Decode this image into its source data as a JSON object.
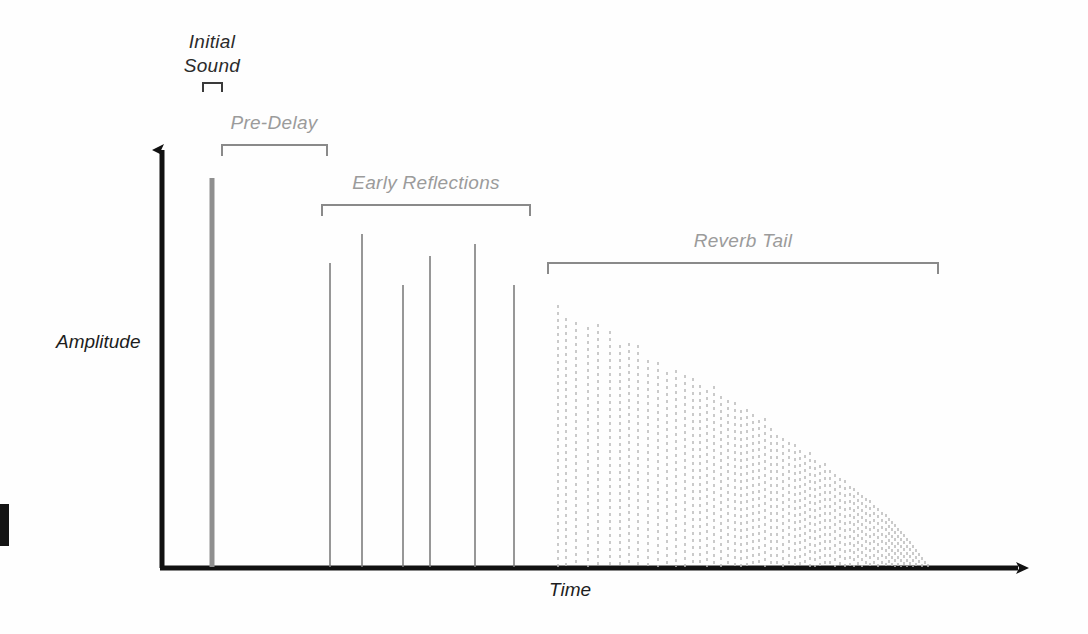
{
  "figure": {
    "axes": {
      "x_label": "Time",
      "y_label": "Amplitude",
      "x_arrow": "arrow-right",
      "y_arrow": "arrow-up"
    },
    "annotations": [
      {
        "id": "initial-sound",
        "label": "Initial Sound",
        "line1": "Initial",
        "line2": "Sound"
      },
      {
        "id": "pre-delay",
        "label": "Pre-Delay"
      },
      {
        "id": "early-reflections",
        "label": "Early Reflections"
      },
      {
        "id": "reverb-tail",
        "label": "Reverb Tail"
      }
    ],
    "colors": {
      "axis": "#111111",
      "label_gray": "#9b9b9b",
      "bracket_gray": "#8a8a8a",
      "early_reflection": "#7d7d7d",
      "reverb_tail": "#b9b9b9",
      "initial_sound": "#8f8f8f",
      "background": "#fefefe"
    }
  },
  "chart_data": {
    "type": "bar",
    "xlabel": "Time",
    "ylabel": "Amplitude",
    "grid": false,
    "legend": "none",
    "xlim": [
      0,
      1088
    ],
    "ylim": [
      0,
      1
    ],
    "baseline_y": 568,
    "axis_x": 162,
    "axis_end_x": 1030,
    "axis_top_y": 138,
    "segments": [
      {
        "name": "Initial Sound",
        "bracket": {
          "x1": 203,
          "x2": 222,
          "y": 83,
          "tick": 9
        },
        "label_xy": [
          212,
          48
        ],
        "impulses": [
          {
            "x": 212,
            "top_y": 178,
            "amplitude": 1.0,
            "style": "solid-thick"
          }
        ]
      },
      {
        "name": "Pre-Delay",
        "bracket": {
          "x1": 222,
          "x2": 327,
          "y": 145,
          "tick": 11
        },
        "label_xy": [
          274,
          129
        ],
        "impulses": []
      },
      {
        "name": "Early Reflections",
        "bracket": {
          "x1": 322,
          "x2": 530,
          "y": 205,
          "tick": 11
        },
        "label_xy": [
          426,
          189
        ],
        "impulses": [
          {
            "x": 330,
            "top_y": 263,
            "amplitude": 0.78
          },
          {
            "x": 362,
            "top_y": 234,
            "amplitude": 0.86
          },
          {
            "x": 403,
            "top_y": 285,
            "amplitude": 0.72
          },
          {
            "x": 430,
            "top_y": 256,
            "amplitude": 0.8
          },
          {
            "x": 475,
            "top_y": 244,
            "amplitude": 0.83
          },
          {
            "x": 514,
            "top_y": 285,
            "amplitude": 0.72
          }
        ]
      },
      {
        "name": "Reverb Tail",
        "bracket": {
          "x1": 548,
          "x2": 938,
          "y": 263,
          "tick": 11
        },
        "label_xy": [
          743,
          247
        ],
        "decay": "exponential",
        "dashed": true,
        "start_x": 558,
        "end_x": 928,
        "peak_top_y": 305,
        "impulses": [
          {
            "x": 558,
            "top_y": 305,
            "amplitude": 0.69
          },
          {
            "x": 566,
            "top_y": 318,
            "amplitude": 0.65
          },
          {
            "x": 576,
            "top_y": 322,
            "amplitude": 0.64
          },
          {
            "x": 588,
            "top_y": 327,
            "amplitude": 0.63
          },
          {
            "x": 598,
            "top_y": 324,
            "amplitude": 0.64
          },
          {
            "x": 610,
            "top_y": 331,
            "amplitude": 0.62
          },
          {
            "x": 620,
            "top_y": 345,
            "amplitude": 0.58
          },
          {
            "x": 629,
            "top_y": 343,
            "amplitude": 0.58
          },
          {
            "x": 638,
            "top_y": 345,
            "amplitude": 0.58
          },
          {
            "x": 648,
            "top_y": 360,
            "amplitude": 0.54
          },
          {
            "x": 658,
            "top_y": 362,
            "amplitude": 0.54
          },
          {
            "x": 667,
            "top_y": 372,
            "amplitude": 0.51
          },
          {
            "x": 676,
            "top_y": 370,
            "amplitude": 0.52
          },
          {
            "x": 685,
            "top_y": 375,
            "amplitude": 0.5
          },
          {
            "x": 693,
            "top_y": 378,
            "amplitude": 0.49
          },
          {
            "x": 700,
            "top_y": 385,
            "amplitude": 0.47
          },
          {
            "x": 707,
            "top_y": 390,
            "amplitude": 0.46
          },
          {
            "x": 714,
            "top_y": 386,
            "amplitude": 0.47
          },
          {
            "x": 721,
            "top_y": 396,
            "amplitude": 0.44
          },
          {
            "x": 728,
            "top_y": 400,
            "amplitude": 0.43
          },
          {
            "x": 735,
            "top_y": 402,
            "amplitude": 0.43
          },
          {
            "x": 741,
            "top_y": 410,
            "amplitude": 0.4
          },
          {
            "x": 747,
            "top_y": 409,
            "amplitude": 0.41
          },
          {
            "x": 753,
            "top_y": 414,
            "amplitude": 0.39
          },
          {
            "x": 759,
            "top_y": 420,
            "amplitude": 0.38
          },
          {
            "x": 765,
            "top_y": 418,
            "amplitude": 0.38
          },
          {
            "x": 771,
            "top_y": 428,
            "amplitude": 0.36
          },
          {
            "x": 777,
            "top_y": 435,
            "amplitude": 0.34
          },
          {
            "x": 783,
            "top_y": 438,
            "amplitude": 0.33
          },
          {
            "x": 789,
            "top_y": 442,
            "amplitude": 0.32
          },
          {
            "x": 795,
            "top_y": 444,
            "amplitude": 0.31
          },
          {
            "x": 800,
            "top_y": 450,
            "amplitude": 0.3
          },
          {
            "x": 805,
            "top_y": 455,
            "amplitude": 0.28
          },
          {
            "x": 810,
            "top_y": 452,
            "amplitude": 0.29
          },
          {
            "x": 815,
            "top_y": 460,
            "amplitude": 0.27
          },
          {
            "x": 820,
            "top_y": 465,
            "amplitude": 0.26
          },
          {
            "x": 825,
            "top_y": 463,
            "amplitude": 0.26
          },
          {
            "x": 830,
            "top_y": 470,
            "amplitude": 0.24
          },
          {
            "x": 835,
            "top_y": 474,
            "amplitude": 0.23
          },
          {
            "x": 840,
            "top_y": 478,
            "amplitude": 0.22
          },
          {
            "x": 845,
            "top_y": 480,
            "amplitude": 0.22
          },
          {
            "x": 850,
            "top_y": 486,
            "amplitude": 0.2
          },
          {
            "x": 854,
            "top_y": 488,
            "amplitude": 0.2
          },
          {
            "x": 858,
            "top_y": 492,
            "amplitude": 0.19
          },
          {
            "x": 862,
            "top_y": 495,
            "amplitude": 0.18
          },
          {
            "x": 866,
            "top_y": 498,
            "amplitude": 0.17
          },
          {
            "x": 870,
            "top_y": 500,
            "amplitude": 0.17
          },
          {
            "x": 874,
            "top_y": 505,
            "amplitude": 0.15
          },
          {
            "x": 878,
            "top_y": 508,
            "amplitude": 0.15
          },
          {
            "x": 882,
            "top_y": 512,
            "amplitude": 0.14
          },
          {
            "x": 886,
            "top_y": 514,
            "amplitude": 0.13
          },
          {
            "x": 889,
            "top_y": 518,
            "amplitude": 0.12
          },
          {
            "x": 892,
            "top_y": 521,
            "amplitude": 0.12
          },
          {
            "x": 895,
            "top_y": 524,
            "amplitude": 0.11
          },
          {
            "x": 898,
            "top_y": 528,
            "amplitude": 0.1
          },
          {
            "x": 901,
            "top_y": 531,
            "amplitude": 0.09
          },
          {
            "x": 904,
            "top_y": 534,
            "amplitude": 0.09
          },
          {
            "x": 907,
            "top_y": 538,
            "amplitude": 0.08
          },
          {
            "x": 910,
            "top_y": 541,
            "amplitude": 0.07
          },
          {
            "x": 913,
            "top_y": 545,
            "amplitude": 0.06
          },
          {
            "x": 916,
            "top_y": 549,
            "amplitude": 0.05
          },
          {
            "x": 919,
            "top_y": 553,
            "amplitude": 0.04
          },
          {
            "x": 922,
            "top_y": 557,
            "amplitude": 0.03
          },
          {
            "x": 925,
            "top_y": 561,
            "amplitude": 0.02
          },
          {
            "x": 928,
            "top_y": 564,
            "amplitude": 0.01
          }
        ]
      }
    ]
  }
}
